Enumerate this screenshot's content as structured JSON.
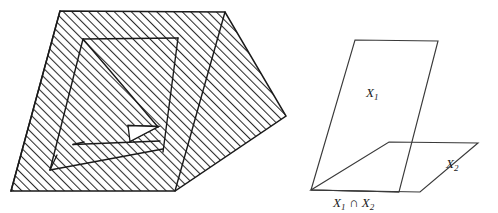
{
  "figure": {
    "title": "",
    "background_color": "#ffffff",
    "stroke_color": "#1a1a1a",
    "hatch_color": "#2b2b2b",
    "panels": [
      {
        "id": "left-panel",
        "name": "hatched-nested-prism-diagram",
        "description": "Hatched quadrilateral region with nested inner quadrilateral, diagonal line and small white triangular hole",
        "filled": true,
        "fill_pattern": "diagonal-hatch-45",
        "labels": []
      },
      {
        "id": "right-panel",
        "name": "two-intersecting-planes-diagram",
        "description": "Two intersecting parallelograms representing planes X1 and X2 meeting along line X1 intersect X2",
        "filled": false,
        "fill_pattern": "none",
        "labels": [
          {
            "id": "label-x1",
            "base": "X",
            "sub": "1",
            "op": "",
            "base2": "",
            "sub2": "",
            "text": "X₁"
          },
          {
            "id": "label-x2",
            "base": "X",
            "sub": "2",
            "op": "",
            "base2": "",
            "sub2": "",
            "text": "X₂"
          },
          {
            "id": "label-x1-cap-x2",
            "base": "X",
            "sub": "1",
            "op": "∩",
            "base2": "X",
            "sub2": "2",
            "text": "X₁ ∩ X₂"
          }
        ]
      }
    ],
    "geometry": {
      "left": {
        "outer_polygon": [
          [
            60,
            11
          ],
          [
            225,
            12
          ],
          [
            286,
            116
          ],
          [
            175,
            191
          ],
          [
            11,
            191
          ]
        ],
        "inner_polygon": [
          [
            83,
            39
          ],
          [
            178,
            38
          ],
          [
            163,
            152
          ],
          [
            50,
            170
          ]
        ],
        "diagonal_line": [
          [
            83,
            39
          ],
          [
            160,
            131
          ]
        ],
        "white_triangle": [
          [
            128,
            125
          ],
          [
            158,
            127
          ],
          [
            130,
            141
          ]
        ],
        "crease_lines": [
          [
            [
              83,
              39
            ],
            [
              50,
              170
            ]
          ],
          [
            [
              178,
              38
            ],
            [
              163,
              152
            ]
          ],
          [
            [
              225,
              12
            ],
            [
              175,
              191
            ]
          ],
          [
            [
              60,
              11
            ],
            [
              11,
              191
            ]
          ],
          [
            [
              73,
              145
            ],
            [
              160,
              141
            ]
          ],
          [
            [
              50,
              170
            ],
            [
              163,
              148
            ]
          ]
        ]
      },
      "right": {
        "plane_x1": [
          [
            355,
            40
          ],
          [
            438,
            41
          ],
          [
            399,
            192
          ],
          [
            311,
            190
          ]
        ],
        "plane_x2": [
          [
            389,
            142
          ],
          [
            478,
            143
          ],
          [
            420,
            192
          ],
          [
            311,
            190
          ]
        ],
        "intersection_line": [
          [
            311,
            190
          ],
          [
            399,
            192
          ]
        ],
        "label_x1_pos": [
          366,
          97
        ],
        "label_x2_pos": [
          446,
          167
        ],
        "label_cap_pos": [
          334,
          206
        ]
      }
    }
  }
}
